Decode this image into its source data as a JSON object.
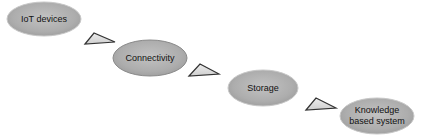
{
  "diagram": {
    "type": "flow",
    "nodes": [
      {
        "id": "iot",
        "label": "IoT devices",
        "lines": [
          "IoT devices"
        ]
      },
      {
        "id": "connectivity",
        "label": "Connectivity",
        "lines": [
          "Connectivity"
        ]
      },
      {
        "id": "storage",
        "label": "Storage",
        "lines": [
          "Storage"
        ]
      },
      {
        "id": "kbs",
        "label": "Knowledge based system",
        "lines": [
          "Knowledge",
          "based system"
        ]
      }
    ],
    "edges": [
      {
        "from": "iot",
        "to": "connectivity",
        "shape": "triangle-arrow"
      },
      {
        "from": "connectivity",
        "to": "storage",
        "shape": "triangle-arrow"
      },
      {
        "from": "storage",
        "to": "kbs",
        "shape": "triangle-arrow"
      }
    ],
    "colors": {
      "node_fill": "#aaaaaa",
      "node_fill_light": "#c4c4c4",
      "arrow_fill": "#dadada",
      "arrow_stroke": "#333333",
      "text": "#111111"
    }
  }
}
